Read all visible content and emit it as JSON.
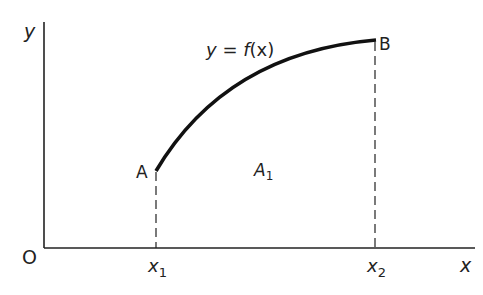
{
  "diagram": {
    "axes": {
      "y_label": "y",
      "x_label": "x",
      "origin_label": "O"
    },
    "curve": {
      "equation_lhs": "y",
      "equation_eq": " = ",
      "equation_f": "f",
      "equation_arg": "(x)"
    },
    "points": {
      "start_label": "A",
      "end_label": "B"
    },
    "ticks": [
      {
        "base": "x",
        "sub": "1"
      },
      {
        "base": "x",
        "sub": "2"
      }
    ],
    "area": {
      "base": "A",
      "sub": "1"
    },
    "colors": {
      "stroke": "#111111",
      "text": "#222222",
      "background": "#ffffff"
    }
  }
}
